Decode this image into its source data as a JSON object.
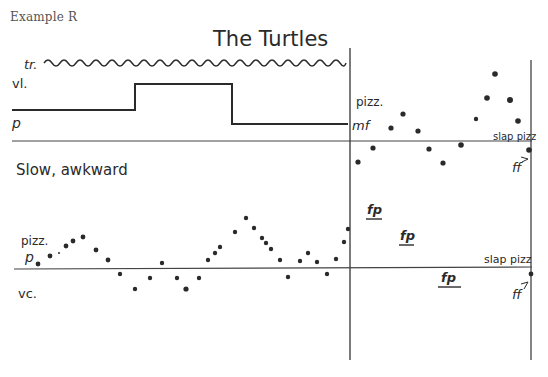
{
  "caption": "Example R",
  "title": "The Turtles",
  "tempo_marking": "Slow, awkward",
  "violin": {
    "trill_label": "tr.",
    "instrument_label": "vl.",
    "dynamic_start": "p",
    "pizz_label": "pizz.",
    "pizz_dynamic": "mf",
    "slap_label": "slap pizz",
    "slap_dynamic": "ff"
  },
  "cello": {
    "pizz_label": "pizz.",
    "dynamic_start": "p",
    "instrument_label": "vc.",
    "fp_markings": [
      "fp",
      "fp",
      "fp"
    ],
    "slap_label": "slap pizz",
    "slap_dynamic": "ff"
  },
  "colors": {
    "ink": "#2a2a2a",
    "caption": "#555555",
    "background": "#ffffff"
  }
}
